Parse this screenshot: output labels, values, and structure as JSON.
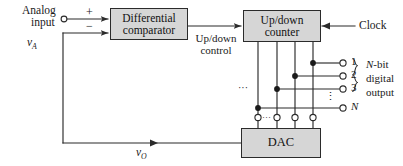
{
  "diagram": {
    "colors": {
      "block_fill": "#d6d6d6",
      "stroke": "#2b2b2b",
      "text": "#111111",
      "background": "#ffffff"
    },
    "blocks": [
      {
        "id": "comparator",
        "label_line1": "Differential",
        "label_line2": "comparator"
      },
      {
        "id": "counter",
        "label_line1": "Up/down",
        "label_line2": "counter"
      },
      {
        "id": "dac",
        "label_line1": "DAC",
        "label_line2": ""
      }
    ],
    "labels": {
      "analog_input_line1": "Analog",
      "analog_input_line2": "input",
      "analog_input_symbol": "v",
      "analog_input_subscript": "A",
      "plus_sign": "+",
      "minus_sign": "−",
      "updown_control_line1": "Up/down",
      "updown_control_line2": "control",
      "clock": "Clock",
      "output_symbol": "v",
      "output_subscript": "O",
      "bus_ellipsis": "···",
      "vertical_ellipsis": "⋮"
    },
    "digital_output": {
      "bit_labels": [
        "1",
        "2",
        "3",
        "N"
      ],
      "caption_line1": "N-bit",
      "caption_line1_italic": "N",
      "caption_line1_rest": "-bit",
      "caption_line2": "digital",
      "caption_line3": "output",
      "brace": "}"
    },
    "terminals": {
      "analog_input_circle": "open-circle",
      "output_bit_circles": 4,
      "dac_top_circles": 4
    }
  }
}
